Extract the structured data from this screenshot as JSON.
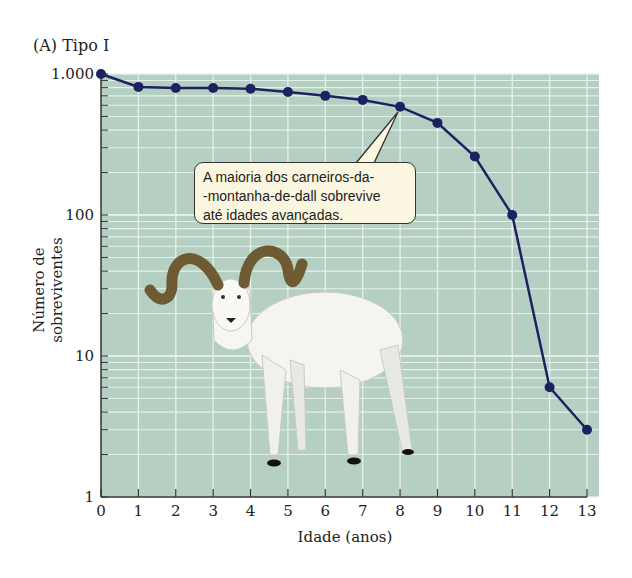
{
  "panel": {
    "label": "(A)  Tipo I"
  },
  "axes": {
    "ylabel": "Número de sobreviventes",
    "xlabel": "Idade (anos)",
    "yticks": [
      "1.000",
      "100",
      "10",
      "1"
    ],
    "xticks": [
      "0",
      "1",
      "2",
      "3",
      "4",
      "5",
      "6",
      "7",
      "8",
      "9",
      "10",
      "11",
      "12",
      "13"
    ]
  },
  "callout": {
    "lines": [
      "A maioria dos carneiros-da-",
      "-montanha-de-dall sobrevive",
      "até idades avançadas."
    ]
  },
  "colors": {
    "plot_bg": "#b5d0c3",
    "grid": "#e6f0ea",
    "line": "#1c2260",
    "callout_bg": "#fbf6df"
  },
  "chart_data": {
    "type": "line",
    "title": "(A) Tipo I",
    "xlabel": "Idade (anos)",
    "ylabel": "Número de sobreviventes",
    "yscale": "log",
    "ylim": [
      1,
      1000
    ],
    "xlim": [
      0,
      13
    ],
    "grid": true,
    "x": [
      0,
      1,
      2,
      3,
      4,
      5,
      6,
      7,
      8,
      9,
      10,
      11,
      12,
      13
    ],
    "series": [
      {
        "name": "Carneiro-da-montanha-de-dall",
        "values": [
          1000,
          810,
          795,
          795,
          785,
          745,
          700,
          655,
          585,
          450,
          260,
          100,
          6,
          3
        ]
      }
    ],
    "annotations": [
      "A maioria dos carneiros-da-montanha-de-dall sobrevive até idades avançadas."
    ]
  }
}
